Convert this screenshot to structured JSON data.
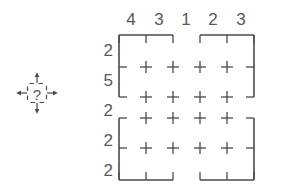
{
  "figure": {
    "type": "nonogram-grid",
    "icon": {
      "name": "move-question-icon",
      "glyph": "?",
      "arrows": [
        "up",
        "down",
        "left",
        "right"
      ],
      "box_style": "dashed"
    },
    "column_labels": [
      "4",
      "3",
      "1",
      "2",
      "3"
    ],
    "row_labels": [
      "2",
      "5",
      "2",
      "2",
      "2"
    ],
    "grid": {
      "columns": 5,
      "rows": 5,
      "interior_marks": "plus",
      "plus_rows": 4,
      "plus_cols": 4,
      "border_style": "bracket-with-gaps",
      "gap_after_column": 2,
      "gap_after_row": 2
    },
    "colors": {
      "stroke": "#4a4a4a",
      "text": "#59595b",
      "background": "#ffffff"
    }
  }
}
